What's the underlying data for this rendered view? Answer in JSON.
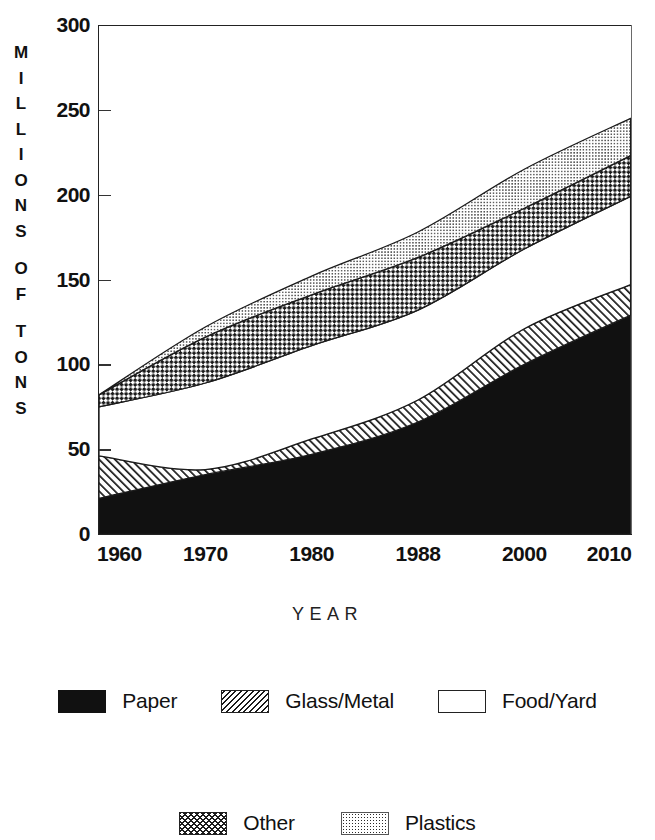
{
  "chart_data": {
    "type": "area",
    "stacked": true,
    "title": "",
    "xlabel": "YEAR",
    "ylabel": "MILLIONS OF TONS",
    "x": [
      "1960",
      "1970",
      "1980",
      "1988",
      "2000",
      "2010"
    ],
    "categories": [
      "1960",
      "1970",
      "1980",
      "1988",
      "2000",
      "2010"
    ],
    "xtick_labels": [
      "1960",
      "1970",
      "1980",
      "1988",
      "2000",
      "2010"
    ],
    "ytick_labels": [
      "0",
      "50",
      "100",
      "150",
      "200",
      "250",
      "300"
    ],
    "ytick_values": [
      0,
      50,
      100,
      150,
      200,
      250,
      300
    ],
    "ylim": [
      0,
      300
    ],
    "grid": false,
    "legend_position": "bottom",
    "series": [
      {
        "name": "Paper",
        "pattern": "solid-black",
        "values": [
          21,
          35,
          47,
          66,
          100,
          129
        ]
      },
      {
        "name": "Glass/Metal",
        "pattern": "diagonal-hatch",
        "values": [
          25,
          3,
          9,
          13,
          21,
          18
        ]
      },
      {
        "name": "Food/Yard",
        "pattern": "white",
        "values": [
          29,
          51,
          55,
          53,
          47,
          52
        ]
      },
      {
        "name": "Other",
        "pattern": "checkerboard",
        "values": [
          7,
          27,
          30,
          31,
          24,
          24
        ]
      },
      {
        "name": "Plastics",
        "pattern": "stipple-dots",
        "values": [
          0,
          6,
          11,
          15,
          23,
          22
        ]
      }
    ],
    "cumulative_tops": {
      "Paper": [
        21,
        35,
        47,
        66,
        100,
        129
      ],
      "Glass/Metal": [
        46,
        38,
        56,
        79,
        121,
        147
      ],
      "Food/Yard": [
        75,
        89,
        111,
        132,
        168,
        199
      ],
      "Other": [
        82,
        116,
        141,
        163,
        192,
        223
      ],
      "Plastics": [
        82,
        122,
        152,
        178,
        215,
        245
      ]
    },
    "totals": [
      82,
      122,
      152,
      178,
      215,
      245
    ]
  },
  "axes": {
    "y_title_letters": [
      "M",
      "I",
      "L",
      "L",
      "I",
      "O",
      "N",
      "S",
      "",
      "O",
      "F",
      "",
      "T",
      "O",
      "N",
      "S"
    ],
    "x_title": "YEAR"
  },
  "legend": {
    "row1": [
      {
        "label": "Paper",
        "swatch": "solid-black-swatch"
      },
      {
        "label": "Glass/Metal",
        "swatch": "diagonal-hatch-swatch"
      },
      {
        "label": "Food/Yard",
        "swatch": "white-box-swatch"
      }
    ],
    "row2": [
      {
        "label": "Other",
        "swatch": "checkerboard-swatch"
      },
      {
        "label": "Plastics",
        "swatch": "stipple-dots-swatch"
      }
    ]
  },
  "colors": {
    "ink": "#111111",
    "axis": "#222222",
    "background": "#ffffff"
  }
}
